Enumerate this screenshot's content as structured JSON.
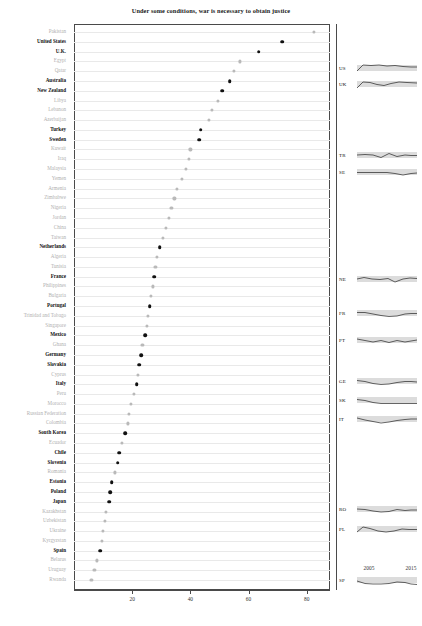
{
  "chart_data": {
    "type": "scatter",
    "title": "Under some conditions, war is necessary to obtain justice",
    "xlabel": "",
    "ylabel": "",
    "xlim": [
      0,
      88
    ],
    "xticks": [
      20,
      40,
      60,
      80
    ],
    "grid": true,
    "legend": "none",
    "categories": [
      "Pakistan",
      "United States",
      "U.K.",
      "Egypt",
      "Qatar",
      "Australia",
      "New Zealand",
      "Libya",
      "Lebanon",
      "Azerbaijan",
      "Turkey",
      "Sweden",
      "Kuwait",
      "Iraq",
      "Malaysia",
      "Yemen",
      "Armenia",
      "Zimbabwe",
      "Nigeria",
      "Jordan",
      "China",
      "Taiwan",
      "Netherlands",
      "Algeria",
      "Tunisia",
      "France",
      "Philippines",
      "Bulgaria",
      "Portugal",
      "Trinidad and Tobago",
      "Singapore",
      "Mexico",
      "Ghana",
      "Germany",
      "Slovakia",
      "Cyprus",
      "Italy",
      "Peru",
      "Morocco",
      "Russian Federation",
      "Colombia",
      "South Korea",
      "Ecuador",
      "Chile",
      "Slovenia",
      "Romania",
      "Estonia",
      "Poland",
      "Japan",
      "Kazakhstan",
      "Uzbekistan",
      "Ukraine",
      "Kyrgyzstan",
      "Spain",
      "Belarus",
      "Uruguay",
      "Rwanda"
    ],
    "values": [
      82.5,
      71.5,
      63.5,
      57.0,
      55.0,
      53.5,
      51.0,
      49.5,
      47.5,
      46.5,
      43.5,
      43.0,
      40.0,
      39.5,
      38.5,
      37.0,
      35.5,
      34.5,
      33.5,
      32.5,
      31.5,
      30.5,
      29.5,
      28.5,
      28.0,
      27.5,
      27.0,
      26.5,
      26.0,
      25.5,
      25.0,
      24.5,
      23.5,
      23.0,
      22.5,
      22.0,
      21.5,
      20.5,
      19.5,
      19.0,
      18.5,
      17.5,
      16.5,
      15.5,
      15.0,
      14.0,
      13.0,
      12.5,
      12.0,
      11.0,
      10.5,
      10.0,
      9.5,
      9.0,
      8.0,
      7.0,
      6.0
    ],
    "highlighted": [
      "United States",
      "U.K.",
      "Australia",
      "New Zealand",
      "Turkey",
      "Sweden",
      "Netherlands",
      "France",
      "Portugal",
      "Mexico",
      "Germany",
      "Slovakia",
      "Italy",
      "South Korea",
      "Chile",
      "Slovenia",
      "Estonia",
      "Poland",
      "Japan",
      "Spain"
    ],
    "colors": {
      "highlight_dot": "#111111",
      "muted_dot": "#b9b9b9",
      "gridline": "#e9e9e9",
      "frame": "#4a4a4a",
      "spark_band": "#dcdcdc"
    }
  },
  "sparklines": {
    "year_start_label": "2005",
    "year_end_label": "2015",
    "series": [
      {
        "code": "US",
        "y": 44,
        "points": "0,9 6,3 14,3.5 22,3 30,4 38,3.5 46,4.5 54,5 60,5"
      },
      {
        "code": "UK",
        "y": 60,
        "points": "0,10 6,4 13,4.5 20,6.5 27,7.5 34,5.5 42,4 50,4.5 60,5"
      },
      {
        "code": "TR",
        "y": 131,
        "points": "0,6 8,5.5 16,6 24,8.5 32,4.5 40,7.5 48,6 54,6.5 60,6.5"
      },
      {
        "code": "SE",
        "y": 148,
        "points": "0,6.5 10,6.5 20,6.5 30,6.5 38,7.5 46,9 54,7.5 60,7"
      },
      {
        "code": "NE",
        "y": 255,
        "points": "0,6 7,4.5 15,6 23,6.5 31,5.5 38,9 46,6 53,5 60,5.5"
      },
      {
        "code": "FR",
        "y": 289,
        "points": "0,5.5 8,5.5 16,7 24,8.5 32,9.5 40,9 48,7 54,6.5 60,6.5"
      },
      {
        "code": "PT",
        "y": 316,
        "points": "0,5 8,6.5 16,8 24,6.5 32,8.5 40,6.5 48,8 54,7 60,6"
      },
      {
        "code": "GE",
        "y": 357,
        "points": "0,5.5 8,6.5 16,8.5 24,9.5 32,9 40,7.5 48,6.5 54,6.5 60,7"
      },
      {
        "code": "SK",
        "y": 376,
        "points": "0,5.5 8,6.5 16,8.5 24,9.5 32,9.5 40,9.5 48,9.5 60,9.5"
      },
      {
        "code": "IT",
        "y": 395,
        "points": "0,5 8,7 16,8.5 24,10 32,9 40,7.5 48,6.5 54,6 60,6"
      },
      {
        "code": "RO",
        "y": 485,
        "points": "0,6 8,6.5 16,8 24,9 32,8.5 40,6.5 48,7.5 54,7 60,7"
      },
      {
        "code": "PL",
        "y": 505,
        "points": "0,9 6,4 13,5.5 21,8 29,9 37,8 45,6 52,6.5 60,6.5"
      },
      {
        "code": "SP",
        "y": 556,
        "points": "0,7 8,9.5 16,10 24,10 32,9.5 40,8 48,8.5 54,10 60,10.5"
      }
    ]
  }
}
